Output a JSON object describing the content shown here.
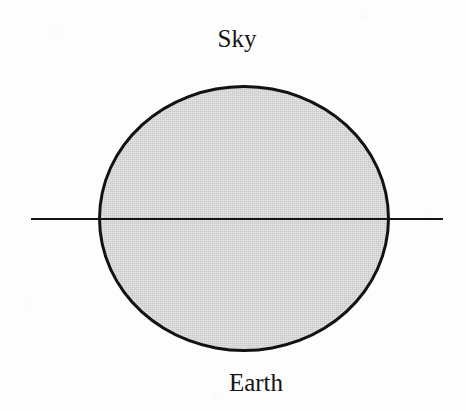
{
  "figure": {
    "canvas": {
      "width": 466,
      "height": 411,
      "background_color": "#fdfdfd"
    },
    "labels": {
      "top": "Sky",
      "bottom": "Earth"
    },
    "shapes": {
      "disc": {
        "name": "shaded-circle",
        "fill_color": "#c9c9c9",
        "outline_color": "#121212",
        "outline_width_px": 3.5,
        "left_px": 98,
        "top_px": 85,
        "width_px": 292,
        "height_px": 267
      },
      "horizon": {
        "name": "horizon-line",
        "color": "#151515",
        "thickness_px": 2,
        "start_x_px": 31,
        "end_x_px": 443,
        "y_px": 219
      }
    },
    "text_color": "#141414"
  }
}
